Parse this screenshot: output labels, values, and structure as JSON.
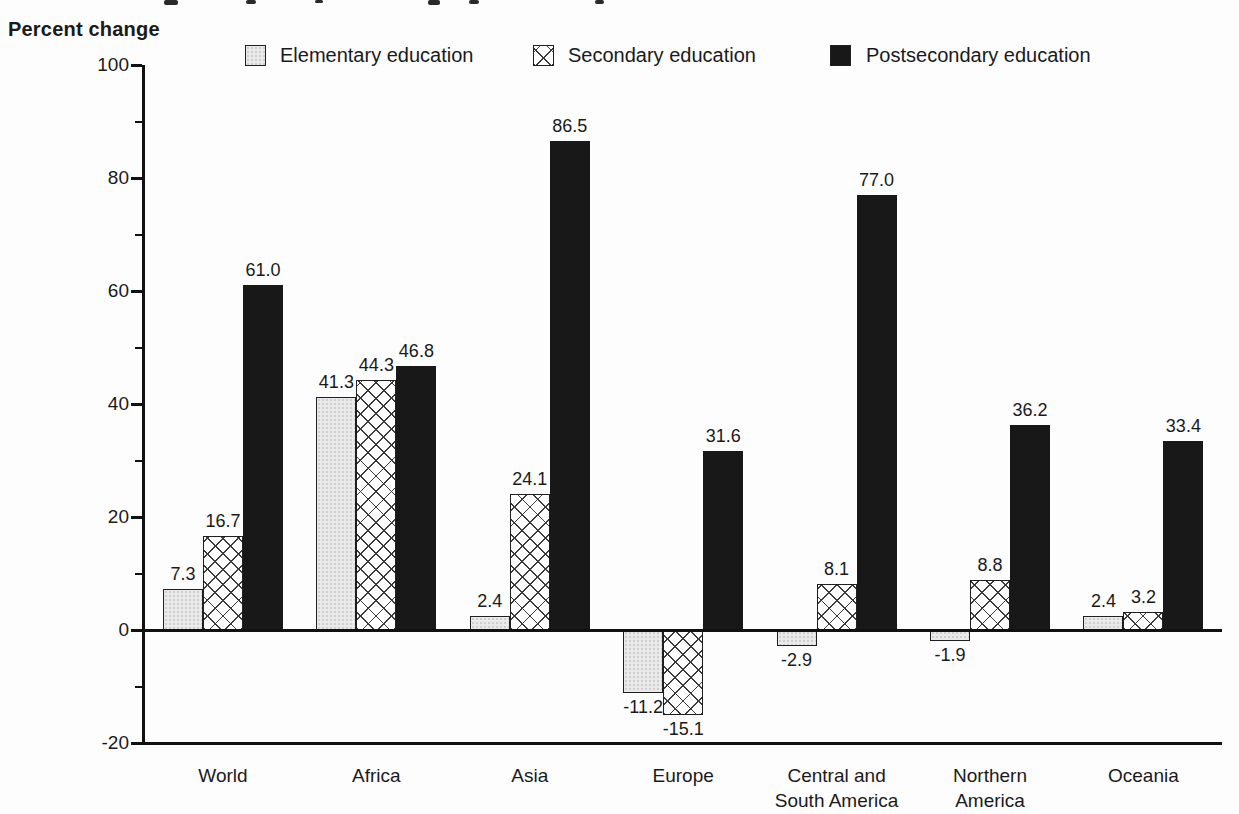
{
  "page": {
    "y_axis_title": "Percent change"
  },
  "chart_data": {
    "type": "bar",
    "title": "",
    "ylabel": "Percent change",
    "xlabel": "",
    "ylim": [
      -20,
      100
    ],
    "grid": false,
    "legend_position": "top",
    "value_labels": true,
    "y_major_ticks": [
      100,
      80,
      60,
      40,
      20,
      0,
      -20
    ],
    "y_minor_ticks": [
      90,
      70,
      50,
      30,
      10,
      -10
    ],
    "categories": [
      "World",
      "Africa",
      "Asia",
      "Europe",
      "Central and South America",
      "Northern America",
      "Oceania"
    ],
    "category_label_lines": [
      [
        "World"
      ],
      [
        "Africa"
      ],
      [
        "Asia"
      ],
      [
        "Europe"
      ],
      [
        "Central and",
        "South America"
      ],
      [
        "Northern",
        "America"
      ],
      [
        "Oceania"
      ]
    ],
    "series": [
      {
        "name": "Elementary education",
        "style": "elementary",
        "values": [
          7.3,
          41.3,
          2.4,
          -11.2,
          -2.9,
          -1.9,
          2.4
        ]
      },
      {
        "name": "Secondary education",
        "style": "secondary",
        "values": [
          16.7,
          44.3,
          24.1,
          -15.1,
          8.1,
          8.8,
          3.2
        ]
      },
      {
        "name": "Postsecondary education",
        "style": "postsecondary",
        "values": [
          61.0,
          46.8,
          86.5,
          31.6,
          77.0,
          36.2,
          33.4
        ]
      }
    ]
  },
  "colors": {
    "bar_black": "#181818",
    "bar_light_fill": "#eaeaea",
    "hatch_line": "#3b3b3b",
    "axis": "#111111",
    "text": "#1a1a1a",
    "background": "#fdfdfd"
  }
}
